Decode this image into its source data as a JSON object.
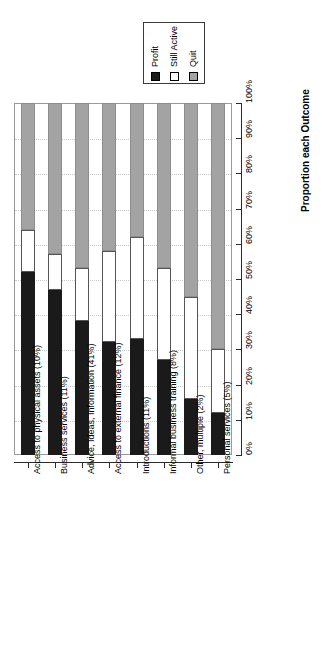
{
  "chart_data": {
    "type": "bar",
    "orientation": "vertical-stacked-rotated",
    "title": "",
    "subtitle": "",
    "xlabel": "",
    "ylabel": "Proportion each Outcome",
    "ylim": [
      0,
      100
    ],
    "grid": true,
    "legend_position": "top-center",
    "legend": [
      "Profit",
      "Still Active",
      "Quit"
    ],
    "series_colors": [
      "#1a1a1a",
      "#ffffff",
      "#a3a3a3"
    ],
    "tick_labels": [
      "0%",
      "10%",
      "20%",
      "30%",
      "40%",
      "50%",
      "60%",
      "70%",
      "80%",
      "90%",
      "100%"
    ],
    "tick_values": [
      0,
      10,
      20,
      30,
      40,
      50,
      60,
      70,
      80,
      90,
      100
    ],
    "categories": [
      "Access to physical assets (10%)",
      "Business services (11%)",
      "Advice, Ideas, Information (41%)",
      "Access to external finance (12%)",
      "Introductions (11%)",
      "Informal business training (8%)",
      "Other, multiple (2%)",
      "Personal services (5%)"
    ],
    "series": [
      {
        "name": "Profit",
        "values": [
          52,
          47,
          38,
          32,
          33,
          27,
          16,
          12
        ]
      },
      {
        "name": "Still Active",
        "values": [
          12,
          10,
          15,
          26,
          29,
          26,
          29,
          18
        ]
      },
      {
        "name": "Quit",
        "values": [
          36,
          43,
          47,
          42,
          38,
          47,
          55,
          70
        ]
      }
    ]
  },
  "legend": {
    "items": [
      {
        "label": "Profit",
        "color": "#1a1a1a"
      },
      {
        "label": "Still Active",
        "color": "#ffffff"
      },
      {
        "label": "Quit",
        "color": "#a3a3a3"
      }
    ]
  },
  "axis": {
    "value_title": "Proportion each Outcome",
    "ticks": [
      "0%",
      "10%",
      "20%",
      "30%",
      "40%",
      "50%",
      "60%",
      "70%",
      "80%",
      "90%",
      "100%"
    ]
  },
  "categories": [
    "Access to physical assets (10%)",
    "Business services (11%)",
    "Advice, Ideas, Information (41%)",
    "Access to external finance (12%)",
    "Introductions (11%)",
    "Informal business training (8%)",
    "Other, multiple (2%)",
    "Personal services (5%)"
  ]
}
